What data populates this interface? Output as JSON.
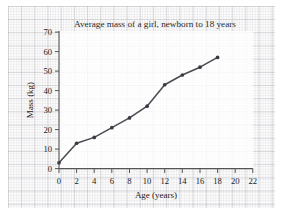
{
  "chart_data": {
    "type": "line",
    "title": "Average mass of a girl, newborn to 18 years",
    "xlabel": "Age (years)",
    "ylabel": "Mass (kg)",
    "x": [
      0,
      2,
      4,
      6,
      8,
      10,
      12,
      14,
      16,
      18
    ],
    "values": [
      3,
      13,
      16,
      21,
      26,
      32,
      43,
      48,
      52,
      57
    ],
    "series": [
      {
        "name": "Average mass",
        "values": [
          3,
          13,
          16,
          21,
          26,
          32,
          43,
          48,
          52,
          57
        ]
      }
    ],
    "xlim": [
      0,
      22
    ],
    "ylim": [
      0,
      70
    ],
    "xticks": [
      0,
      2,
      4,
      6,
      8,
      10,
      12,
      14,
      16,
      18,
      20,
      22
    ],
    "yticks": [
      0,
      10,
      20,
      30,
      40,
      50,
      60,
      70
    ],
    "xtick_labels": [
      "0",
      "2",
      "4",
      "6",
      "8",
      "10",
      "12",
      "14",
      "16",
      "18",
      "20",
      "22"
    ],
    "ytick_labels": [
      "0",
      "10",
      "20",
      "30",
      "40",
      "50",
      "60",
      "70"
    ],
    "grid": "graph-paper background",
    "legend": "none",
    "marker": "filled-circle",
    "line_color": "#4a4a52",
    "marker_color": "#3a3a42",
    "axis_color": "#555555",
    "background_color": "#fdfdfd"
  }
}
